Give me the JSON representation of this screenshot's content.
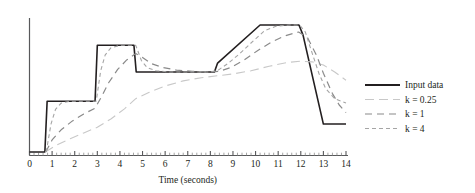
{
  "chart_data": {
    "type": "line",
    "title": "",
    "subtitle": "",
    "xlabel": "Time (seconds)",
    "ylabel": "",
    "xlim": [
      0,
      14
    ],
    "ylim": [
      0,
      1.15
    ],
    "grid": false,
    "legend_position": "right",
    "x_ticks": [
      "0",
      "1",
      "2",
      "3",
      "4",
      "5",
      "6",
      "7",
      "8",
      "9",
      "10",
      "11",
      "12",
      "13",
      "14"
    ],
    "x_tick_values": [
      0,
      1,
      2,
      3,
      4,
      5,
      6,
      7,
      8,
      9,
      10,
      11,
      12,
      13,
      14
    ],
    "minor_ticks_per_interval": 5,
    "y_axis_visible": true,
    "y_ticks": [],
    "series": [
      {
        "name": "Input data",
        "color": "#231f20",
        "style": "solid",
        "width": 1.6,
        "points": [
          [
            0.0,
            0.0
          ],
          [
            0.68,
            0.0
          ],
          [
            0.78,
            0.4
          ],
          [
            2.9,
            0.4
          ],
          [
            3.0,
            0.84
          ],
          [
            4.62,
            0.84
          ],
          [
            4.72,
            0.63
          ],
          [
            8.18,
            0.63
          ],
          [
            8.32,
            0.7
          ],
          [
            10.2,
            1.0
          ],
          [
            11.92,
            1.0
          ],
          [
            12.1,
            0.92
          ],
          [
            13.0,
            0.22
          ],
          [
            14.0,
            0.22
          ]
        ]
      },
      {
        "name": "k = 0.25",
        "color": "#c8c8c8",
        "style": "dashed-long",
        "width": 1.1,
        "points": [
          [
            0.7,
            0.0
          ],
          [
            1.2,
            0.055
          ],
          [
            1.8,
            0.105
          ],
          [
            2.4,
            0.15
          ],
          [
            3.0,
            0.195
          ],
          [
            3.6,
            0.26
          ],
          [
            4.2,
            0.34
          ],
          [
            4.7,
            0.42
          ],
          [
            5.3,
            0.47
          ],
          [
            6.0,
            0.52
          ],
          [
            6.8,
            0.56
          ],
          [
            7.6,
            0.585
          ],
          [
            8.3,
            0.6
          ],
          [
            9.0,
            0.615
          ],
          [
            9.8,
            0.64
          ],
          [
            10.6,
            0.675
          ],
          [
            11.4,
            0.705
          ],
          [
            12.0,
            0.715
          ],
          [
            12.5,
            0.71
          ],
          [
            13.0,
            0.685
          ],
          [
            13.5,
            0.63
          ],
          [
            14.0,
            0.565
          ]
        ]
      },
      {
        "name": "k = 1",
        "color": "#8a8a8a",
        "style": "dashed-medium",
        "width": 1.2,
        "points": [
          [
            0.72,
            0.0
          ],
          [
            1.0,
            0.095
          ],
          [
            1.4,
            0.175
          ],
          [
            1.9,
            0.245
          ],
          [
            2.4,
            0.3
          ],
          [
            2.9,
            0.345
          ],
          [
            3.2,
            0.44
          ],
          [
            3.5,
            0.545
          ],
          [
            3.9,
            0.65
          ],
          [
            4.3,
            0.725
          ],
          [
            4.7,
            0.775
          ],
          [
            5.0,
            0.745
          ],
          [
            5.4,
            0.695
          ],
          [
            5.9,
            0.665
          ],
          [
            6.5,
            0.645
          ],
          [
            7.2,
            0.635
          ],
          [
            8.0,
            0.63
          ],
          [
            8.4,
            0.635
          ],
          [
            8.9,
            0.665
          ],
          [
            9.5,
            0.725
          ],
          [
            10.1,
            0.8
          ],
          [
            10.7,
            0.865
          ],
          [
            11.3,
            0.915
          ],
          [
            11.9,
            0.945
          ],
          [
            12.3,
            0.9
          ],
          [
            12.7,
            0.76
          ],
          [
            13.0,
            0.62
          ],
          [
            13.4,
            0.46
          ],
          [
            13.7,
            0.37
          ],
          [
            14.0,
            0.31
          ]
        ]
      },
      {
        "name": "k = 4",
        "color": "#a5a5a5",
        "style": "dashed-short",
        "width": 1.1,
        "points": [
          [
            0.74,
            0.0
          ],
          [
            0.95,
            0.22
          ],
          [
            1.15,
            0.335
          ],
          [
            1.4,
            0.385
          ],
          [
            1.8,
            0.4
          ],
          [
            2.4,
            0.4
          ],
          [
            2.95,
            0.4
          ],
          [
            3.15,
            0.64
          ],
          [
            3.35,
            0.765
          ],
          [
            3.6,
            0.82
          ],
          [
            4.0,
            0.84
          ],
          [
            4.4,
            0.84
          ],
          [
            4.7,
            0.84
          ],
          [
            4.95,
            0.72
          ],
          [
            5.2,
            0.665
          ],
          [
            5.6,
            0.64
          ],
          [
            6.2,
            0.63
          ],
          [
            7.0,
            0.63
          ],
          [
            8.0,
            0.63
          ],
          [
            8.35,
            0.645
          ],
          [
            8.8,
            0.7
          ],
          [
            9.3,
            0.775
          ],
          [
            9.9,
            0.875
          ],
          [
            10.4,
            0.955
          ],
          [
            10.9,
            0.99
          ],
          [
            11.5,
            1.0
          ],
          [
            11.95,
            1.0
          ],
          [
            12.2,
            0.945
          ],
          [
            12.5,
            0.78
          ],
          [
            12.8,
            0.62
          ],
          [
            13.1,
            0.5
          ],
          [
            13.5,
            0.42
          ],
          [
            14.0,
            0.385
          ]
        ]
      }
    ]
  },
  "legend": {
    "entries": [
      {
        "label": "Input data"
      },
      {
        "label": "k = 0.25"
      },
      {
        "label": "k = 1"
      },
      {
        "label": "k = 4"
      }
    ]
  },
  "axes": {
    "x_title": "Time (seconds)"
  }
}
